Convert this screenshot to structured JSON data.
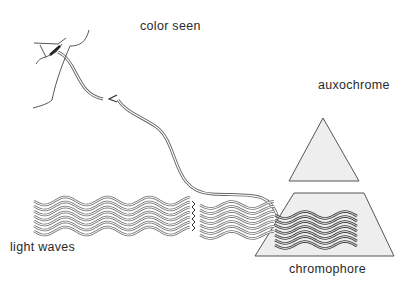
{
  "labels": {
    "color_seen": "color seen",
    "auxochrome": "auxochrome",
    "light_waves": "light waves",
    "chromophore": "chromophore"
  },
  "colors": {
    "line": "#555555",
    "dark_wave": "#3a3a3a",
    "shape_fill": "#eeeeee",
    "text": "#2a2a2a"
  }
}
